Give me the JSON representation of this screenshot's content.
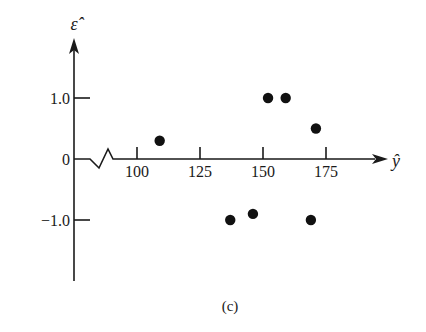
{
  "chart_data": {
    "type": "scatter",
    "title": "",
    "caption": "(c)",
    "xlabel": "ŷ",
    "ylabel": "ε̂",
    "x_ticks": [
      100,
      125,
      150,
      175
    ],
    "x_tick_labels": [
      "100",
      "125",
      "150",
      "175"
    ],
    "y_ticks": [
      1.0,
      0,
      -1.0
    ],
    "y_tick_labels": [
      "1.0",
      "0",
      "−1.0"
    ],
    "x_axis_break": true,
    "xlim": [
      85,
      190
    ],
    "ylim": [
      -2.0,
      2.0
    ],
    "grid": false,
    "legend": null,
    "series": [
      {
        "name": "residuals",
        "points": [
          {
            "x": 109,
            "y": 0.3
          },
          {
            "x": 137,
            "y": -1.0
          },
          {
            "x": 146,
            "y": -0.9
          },
          {
            "x": 152,
            "y": 1.0
          },
          {
            "x": 159,
            "y": 1.0
          },
          {
            "x": 169,
            "y": -1.0
          },
          {
            "x": 171,
            "y": 0.5
          }
        ]
      }
    ],
    "colors": {
      "ink": "#1a1a1a",
      "point": "#111111",
      "background": "#ffffff"
    }
  }
}
